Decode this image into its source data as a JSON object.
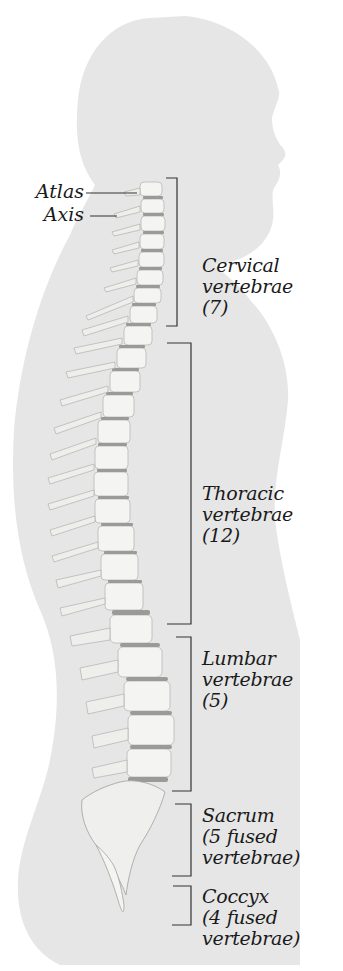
{
  "diagram": {
    "colors": {
      "silhouette": "#e6e6e6",
      "bone": "#f4f4f2",
      "bone_shade": "#c9c9c6",
      "disc": "#9a9a98",
      "line": "#333333",
      "text": "#1a1a1a"
    },
    "pointer_labels": [
      {
        "id": "atlas",
        "text": "Atlas"
      },
      {
        "id": "axis",
        "text": "Axis"
      }
    ],
    "regions": [
      {
        "id": "cervical",
        "lines": [
          "Cervical",
          "vertebrae",
          "(7)"
        ],
        "bracket_top": 178,
        "bracket_bottom": 326
      },
      {
        "id": "thoracic",
        "lines": [
          "Thoracic",
          "vertebrae",
          "(12)"
        ],
        "bracket_top": 343,
        "bracket_bottom": 624
      },
      {
        "id": "lumbar",
        "lines": [
          "Lumbar",
          "vertebrae",
          "(5)"
        ],
        "bracket_top": 637,
        "bracket_bottom": 791
      },
      {
        "id": "sacrum",
        "lines": [
          "Sacrum",
          "(5 fused",
          "vertebrae)"
        ],
        "bracket_top": 804,
        "bracket_bottom": 876
      },
      {
        "id": "coccyx",
        "lines": [
          "Coccyx",
          "(4 fused",
          "vertebrae)"
        ],
        "bracket_top": 886,
        "bracket_bottom": 925
      }
    ]
  }
}
